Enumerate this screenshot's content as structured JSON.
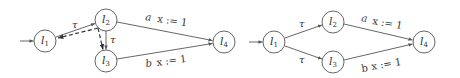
{
  "diagrams": [
    {
      "name": "left",
      "nodes": [
        {
          "id": "l1",
          "label": "l",
          "sub": "1",
          "cx": 45,
          "cy": 41
        },
        {
          "id": "l2",
          "label": "l",
          "sub": "2",
          "cx": 106,
          "cy": 20
        },
        {
          "id": "l3",
          "label": "l",
          "sub": "3",
          "cx": 106,
          "cy": 61
        },
        {
          "id": "l4",
          "label": "l",
          "sub": "4",
          "cx": 224,
          "cy": 42
        }
      ],
      "edges": [
        {
          "from": "start",
          "to": "l1",
          "label": ""
        },
        {
          "from": "l1",
          "to": "l2",
          "label": "τ"
        },
        {
          "from": "l2",
          "to": "l3",
          "label": "τ"
        },
        {
          "from": "l2",
          "to": "l4",
          "label_action": "a",
          "label_update": "x := 1"
        },
        {
          "from": "l3",
          "to": "l4",
          "label_action": "b",
          "label_update": "x := 1"
        },
        {
          "from": "l2",
          "to": "l1",
          "label": "",
          "style": "dashed"
        },
        {
          "from": "l2",
          "to": "l3",
          "label": "",
          "style": "dashed"
        }
      ]
    },
    {
      "name": "right",
      "nodes": [
        {
          "id": "l1",
          "label": "l",
          "sub": "1",
          "cx": 274,
          "cy": 42
        },
        {
          "id": "l2",
          "label": "l",
          "sub": "2",
          "cx": 333,
          "cy": 22
        },
        {
          "id": "l3",
          "label": "l",
          "sub": "3",
          "cx": 333,
          "cy": 62
        },
        {
          "id": "l4",
          "label": "l",
          "sub": "4",
          "cx": 424,
          "cy": 42
        }
      ],
      "edges": [
        {
          "from": "start",
          "to": "l1",
          "label": ""
        },
        {
          "from": "l1",
          "to": "l2",
          "label": "τ"
        },
        {
          "from": "l1",
          "to": "l3",
          "label": "τ"
        },
        {
          "from": "l2",
          "to": "l4",
          "label_action": "a",
          "label_update": "x := 1"
        },
        {
          "from": "l3",
          "to": "l4",
          "label_action": "b",
          "label_update": "x := 1"
        }
      ]
    }
  ],
  "labels": {
    "tau": "τ",
    "l": "l",
    "s1": "1",
    "s2": "2",
    "s3": "3",
    "s4": "4",
    "a": "a",
    "b": "b",
    "update": "x := 1"
  }
}
